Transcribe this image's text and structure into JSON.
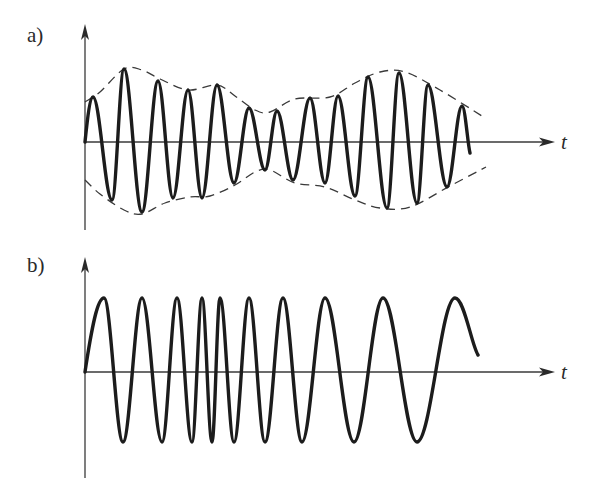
{
  "figure": {
    "panels": [
      {
        "id": "a",
        "label": "a)",
        "axis_label": "t",
        "description": "Amplitude-modulated carrier wave with dashed envelope",
        "origin": [
          85,
          142
        ],
        "y_axis_top": 24,
        "y_axis_bottom": 230,
        "x_axis_end": 555,
        "wave_extrema": [
          [
            85,
            142
          ],
          [
            93,
            97
          ],
          [
            112,
            200
          ],
          [
            124,
            69
          ],
          [
            142,
            212
          ],
          [
            158,
            81
          ],
          [
            173,
            198
          ],
          [
            188,
            90
          ],
          [
            202,
            198
          ],
          [
            217,
            85
          ],
          [
            234,
            183
          ],
          [
            249,
            108
          ],
          [
            265,
            170
          ],
          [
            277,
            111
          ],
          [
            293,
            180
          ],
          [
            310,
            98
          ],
          [
            325,
            183
          ],
          [
            338,
            96
          ],
          [
            355,
            196
          ],
          [
            368,
            77
          ],
          [
            387,
            208
          ],
          [
            399,
            73
          ],
          [
            417,
            203
          ],
          [
            428,
            85
          ],
          [
            447,
            187
          ],
          [
            462,
            106
          ],
          [
            470,
            153
          ]
        ],
        "envelope_upper": [
          [
            85,
            102
          ],
          [
            100,
            92
          ],
          [
            124,
            69
          ],
          [
            142,
            70
          ],
          [
            160,
            79
          ],
          [
            188,
            90
          ],
          [
            217,
            85
          ],
          [
            235,
            96
          ],
          [
            255,
            110
          ],
          [
            270,
            112
          ],
          [
            295,
            99
          ],
          [
            330,
            97
          ],
          [
            355,
            83
          ],
          [
            380,
            72
          ],
          [
            405,
            72
          ],
          [
            440,
            90
          ],
          [
            482,
            116
          ]
        ],
        "envelope_lower": [
          [
            85,
            180
          ],
          [
            100,
            194
          ],
          [
            124,
            210
          ],
          [
            142,
            214
          ],
          [
            165,
            203
          ],
          [
            190,
            197
          ],
          [
            210,
            196
          ],
          [
            235,
            185
          ],
          [
            255,
            172
          ],
          [
            270,
            170
          ],
          [
            295,
            183
          ],
          [
            325,
            187
          ],
          [
            355,
            200
          ],
          [
            380,
            208
          ],
          [
            410,
            207
          ],
          [
            450,
            186
          ],
          [
            486,
            167
          ]
        ]
      },
      {
        "id": "b",
        "label": "b)",
        "axis_label": "t",
        "description": "Frequency-modulated wave with constant amplitude",
        "origin": [
          85,
          372
        ],
        "y_axis_top": 257,
        "y_axis_bottom": 478,
        "x_axis_end": 555,
        "wave_extrema": [
          [
            85,
            372
          ],
          [
            104,
            298
          ],
          [
            123,
            442
          ],
          [
            142,
            298
          ],
          [
            162,
            442
          ],
          [
            177,
            298
          ],
          [
            192,
            442
          ],
          [
            202,
            298
          ],
          [
            212,
            442
          ],
          [
            220,
            298
          ],
          [
            234,
            442
          ],
          [
            249,
            298
          ],
          [
            265,
            442
          ],
          [
            283,
            298
          ],
          [
            302,
            442
          ],
          [
            325,
            298
          ],
          [
            354,
            442
          ],
          [
            383,
            298
          ],
          [
            417,
            442
          ],
          [
            455,
            298
          ],
          [
            478,
            355
          ]
        ]
      }
    ]
  }
}
